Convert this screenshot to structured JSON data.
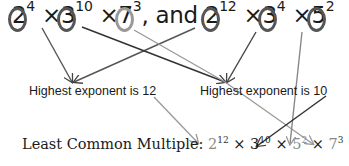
{
  "top_expression": {
    "first": [
      {
        "base": "2",
        "exp": "4",
        "circled": true,
        "ring": "dark"
      },
      {
        "sep": "×"
      },
      {
        "base": "3",
        "exp": "10",
        "circled": true,
        "ring": "dark"
      },
      {
        "sep": "×"
      },
      {
        "base": "7",
        "exp": "3",
        "circled": true,
        "ring": "light"
      }
    ],
    "conjunction": ", and",
    "second": [
      {
        "base": "2",
        "exp": "12",
        "circled": true,
        "ring": "dark"
      },
      {
        "sep": "×"
      },
      {
        "base": "3",
        "exp": "4",
        "circled": true,
        "ring": "dark"
      },
      {
        "sep": "×"
      },
      {
        "base": "5",
        "exp": "2",
        "circled": true,
        "ring": "dark"
      }
    ]
  },
  "labels": {
    "left": "Highest exponent is 12",
    "right": "Highest exponent is 10"
  },
  "lcm": {
    "label": "Least Common Multiple:",
    "terms": [
      {
        "base": "2",
        "exp": "12"
      },
      {
        "base": "3",
        "exp": "10"
      },
      {
        "base": "5",
        "exp": "2"
      },
      {
        "base": "7",
        "exp": "3"
      }
    ],
    "sep": "×"
  },
  "colors": {
    "dark_line": "#444444",
    "light_line": "#9a9a9a",
    "text": "#1a1a1a"
  }
}
